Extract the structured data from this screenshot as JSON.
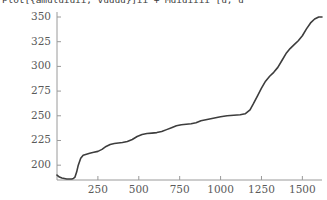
{
  "title": {
    "text": "Plot[{amuluiuii, vuuuu}]ii + Muiuiiii [u, u"
  },
  "chart_data": {
    "type": "line",
    "title": "Plot[{amuluiuii, vuuuu}]ii + Muiuiiii [u, u",
    "xlabel": "",
    "ylabel": "",
    "xlim": [
      0,
      1620
    ],
    "ylim": [
      185,
      352
    ],
    "grid": false,
    "legend": null,
    "xticks": [
      250,
      500,
      750,
      1000,
      1250,
      1500
    ],
    "xtick_labels": [
      "250",
      "500",
      "750",
      "1000",
      "1250",
      "1500"
    ],
    "yticks": [
      200,
      225,
      250,
      275,
      300,
      325,
      350
    ],
    "ytick_labels": [
      "200",
      "225",
      "250",
      "275",
      "300",
      "325",
      "350"
    ],
    "line_color": "#3d3d3d",
    "line_width": 1.6,
    "series": [
      {
        "name": "curve",
        "x": [
          0,
          15,
          30,
          45,
          60,
          75,
          90,
          100,
          110,
          120,
          130,
          145,
          160,
          180,
          200,
          225,
          250,
          275,
          300,
          325,
          350,
          375,
          400,
          430,
          460,
          490,
          520,
          550,
          580,
          610,
          640,
          670,
          700,
          730,
          760,
          790,
          820,
          850,
          880,
          910,
          940,
          970,
          1000,
          1040,
          1080,
          1120,
          1150,
          1180,
          1200,
          1225,
          1250,
          1275,
          1300,
          1325,
          1350,
          1375,
          1400,
          1425,
          1450,
          1475,
          1500,
          1525,
          1550,
          1575,
          1600,
          1620
        ],
        "y": [
          190,
          188,
          187,
          186.5,
          186,
          186,
          186,
          186.5,
          188,
          193,
          200,
          207,
          210,
          211,
          212,
          213,
          214,
          216,
          219,
          221,
          222,
          222.5,
          223,
          224,
          226,
          229,
          231,
          232,
          232.5,
          233,
          234,
          236,
          238,
          240,
          241,
          241.5,
          242,
          243,
          245,
          246,
          247,
          248,
          249,
          250,
          250.5,
          251,
          252,
          256,
          262,
          270,
          278,
          285,
          290,
          294,
          299,
          306,
          313,
          318,
          322,
          326,
          331,
          338,
          344,
          348,
          350,
          350
        ]
      }
    ]
  },
  "axis": {
    "y_axis_color": "#9a9a9a",
    "x_axis_color": "#9a9a9a"
  }
}
